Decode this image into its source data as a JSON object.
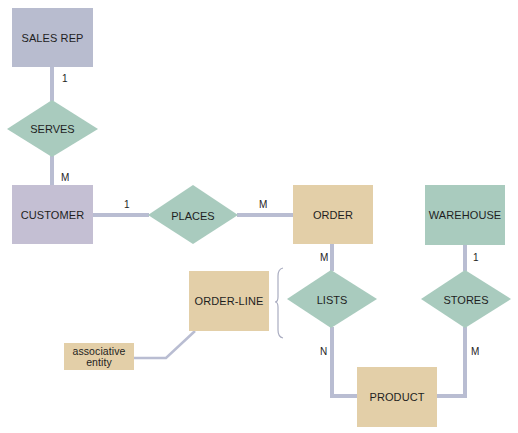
{
  "colors": {
    "line": "#b9bdd2",
    "sales_rep": "#b8bccf",
    "customer": "#c4bfd3",
    "order_group": "#e3cfa8",
    "relationship": "#a9cbbe",
    "warehouse": "#a9cbbe",
    "brace": "#a9acc0"
  },
  "entities": {
    "sales_rep": "SALES REP",
    "customer": "CUSTOMER",
    "order": "ORDER",
    "warehouse": "WAREHOUSE",
    "order_line": "ORDER-LINE",
    "product": "PRODUCT",
    "associative_entity": "associative entity"
  },
  "relationships": {
    "serves": "SERVES",
    "places": "PLACES",
    "lists": "LISTS",
    "stores": "STORES"
  },
  "cardinalities": {
    "sales_rep_serves": "1",
    "serves_customer": "M",
    "customer_places": "1",
    "places_order": "M",
    "order_lists": "M",
    "lists_product": "N",
    "warehouse_stores": "1",
    "stores_product": "M"
  }
}
